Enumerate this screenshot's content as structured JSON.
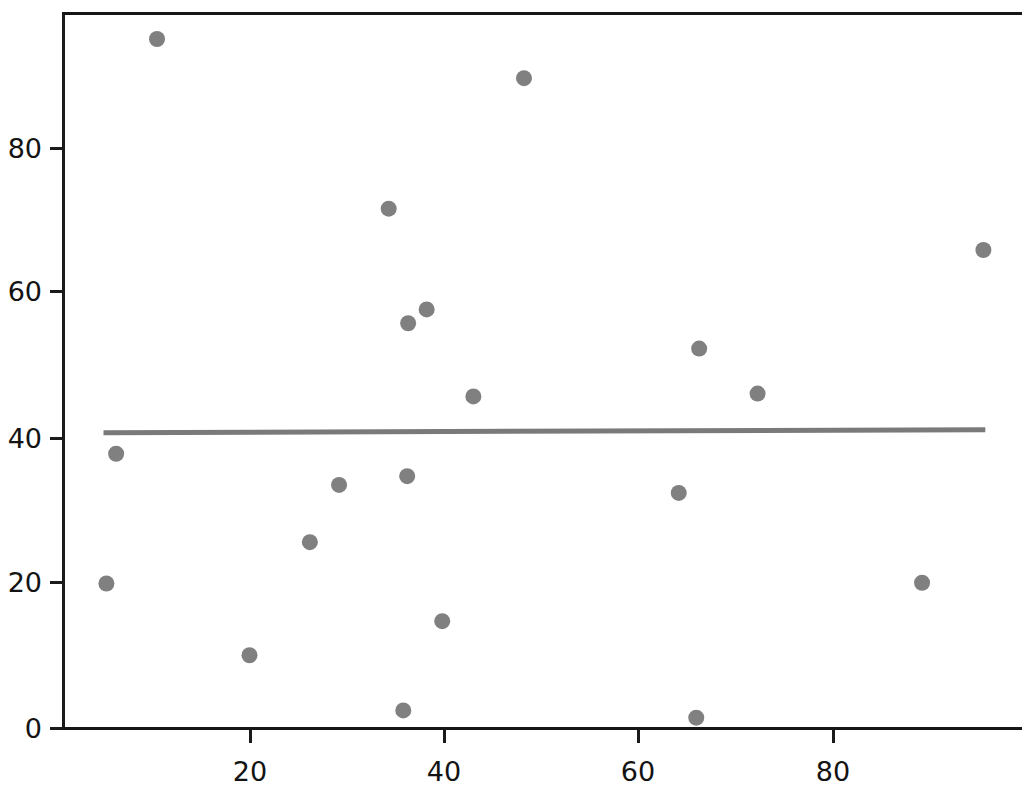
{
  "chart_data": {
    "type": "scatter",
    "title": "",
    "subtitle": "",
    "xlabel": "",
    "ylabel": "",
    "xlim": [
      0,
      99
    ],
    "ylim": [
      -2,
      99
    ],
    "grid": false,
    "legend": null,
    "x_ticks": [
      20,
      40,
      60,
      80
    ],
    "x_tick_labels": [
      "20",
      "40",
      "60",
      "80"
    ],
    "y_ticks": [
      0,
      20,
      40,
      60,
      80
    ],
    "y_tick_labels": [
      "0",
      "20",
      "40",
      "60",
      "80"
    ],
    "marker": {
      "shape": "circle",
      "color": "#808080",
      "size_px": 16,
      "edge_color": "#808080"
    },
    "series": [
      {
        "name": "points",
        "type": "scatter",
        "points": [
          {
            "x": 5.3,
            "y": 20.0
          },
          {
            "x": 6.3,
            "y": 37.9
          },
          {
            "x": 10.5,
            "y": 95.1
          },
          {
            "x": 20.0,
            "y": 10.1
          },
          {
            "x": 26.2,
            "y": 25.7
          },
          {
            "x": 29.2,
            "y": 33.6
          },
          {
            "x": 34.3,
            "y": 71.7
          },
          {
            "x": 35.8,
            "y": 2.5
          },
          {
            "x": 36.2,
            "y": 34.8
          },
          {
            "x": 36.3,
            "y": 55.9
          },
          {
            "x": 38.2,
            "y": 57.8
          },
          {
            "x": 39.8,
            "y": 14.8
          },
          {
            "x": 43.0,
            "y": 45.8
          },
          {
            "x": 48.2,
            "y": 89.7
          },
          {
            "x": 64.1,
            "y": 32.5
          },
          {
            "x": 66.2,
            "y": 52.4
          },
          {
            "x": 65.9,
            "y": 1.5
          },
          {
            "x": 72.2,
            "y": 46.2
          },
          {
            "x": 89.1,
            "y": 20.1
          },
          {
            "x": 95.4,
            "y": 66.0
          }
        ]
      },
      {
        "name": "regression-line",
        "type": "line",
        "color": "#7a7a7a",
        "width_px": 5,
        "x_start": 5.0,
        "y_start": 40.8,
        "x_end": 95.6,
        "y_end": 41.2
      }
    ]
  },
  "axes": {
    "spine_color": "#161616",
    "tick_color": "#1a1a1a",
    "tick_label_color": "#131313",
    "background": "#ffffff"
  }
}
